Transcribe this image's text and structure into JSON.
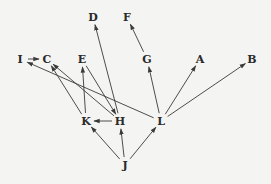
{
  "diagram": {
    "type": "directed-graph",
    "colors": {
      "background": "#f4f4f2",
      "edge": "#3a3a3a",
      "label": "#2a2a2a"
    },
    "nodes": [
      {
        "id": "D",
        "label": "D",
        "x": 93,
        "y": 17
      },
      {
        "id": "F",
        "label": "F",
        "x": 127,
        "y": 17
      },
      {
        "id": "I",
        "label": "I",
        "x": 20,
        "y": 59
      },
      {
        "id": "C",
        "label": "C",
        "x": 47,
        "y": 59
      },
      {
        "id": "E",
        "label": "E",
        "x": 82,
        "y": 59
      },
      {
        "id": "G",
        "label": "G",
        "x": 147,
        "y": 59
      },
      {
        "id": "A",
        "label": "A",
        "x": 200,
        "y": 59
      },
      {
        "id": "B",
        "label": "B",
        "x": 252,
        "y": 59
      },
      {
        "id": "K",
        "label": "K",
        "x": 86,
        "y": 121
      },
      {
        "id": "H",
        "label": "H",
        "x": 120,
        "y": 121
      },
      {
        "id": "L",
        "label": "L",
        "x": 161,
        "y": 121
      },
      {
        "id": "J",
        "label": "J",
        "x": 125,
        "y": 165
      }
    ],
    "edges": [
      {
        "from": "I",
        "to": "C"
      },
      {
        "from": "K",
        "to": "C"
      },
      {
        "from": "H",
        "to": "C"
      },
      {
        "from": "L",
        "to": "I"
      },
      {
        "from": "K",
        "to": "E"
      },
      {
        "from": "E",
        "to": "H"
      },
      {
        "from": "H",
        "to": "D"
      },
      {
        "from": "G",
        "to": "F"
      },
      {
        "from": "L",
        "to": "G"
      },
      {
        "from": "L",
        "to": "A"
      },
      {
        "from": "L",
        "to": "B"
      },
      {
        "from": "H",
        "to": "K"
      },
      {
        "from": "J",
        "to": "K"
      },
      {
        "from": "J",
        "to": "H"
      },
      {
        "from": "J",
        "to": "L"
      }
    ]
  }
}
